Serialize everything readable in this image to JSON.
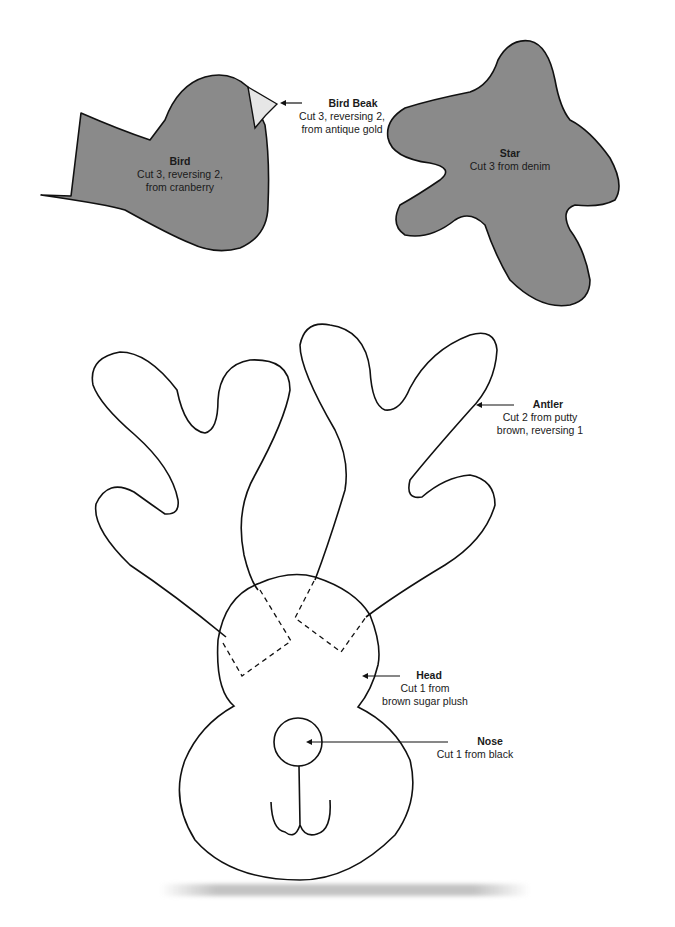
{
  "pieces": {
    "bird": {
      "title": "Bird",
      "desc1": "Cut 3, reversing 2,",
      "desc2": "from cranberry",
      "fill": "#8a8a8a"
    },
    "beak": {
      "title": "Bird Beak",
      "desc1": "Cut 3, reversing 2,",
      "desc2": "from antique gold",
      "fill": "#e6e6e6"
    },
    "star": {
      "title": "Star",
      "desc1": "Cut 3 from denim",
      "fill": "#8a8a8a"
    },
    "antler": {
      "title": "Antler",
      "desc1": "Cut 2 from putty",
      "desc2": "brown, reversing 1"
    },
    "head": {
      "title": "Head",
      "desc1": "Cut 1 from",
      "desc2": "brown sugar plush"
    },
    "nose": {
      "title": "Nose",
      "desc1": "Cut 1 from black"
    }
  },
  "colors": {
    "outline": "#111111",
    "fabric_fill": "#8a8a8a",
    "beak_fill": "#e6e6e6",
    "paper": "#ffffff"
  }
}
